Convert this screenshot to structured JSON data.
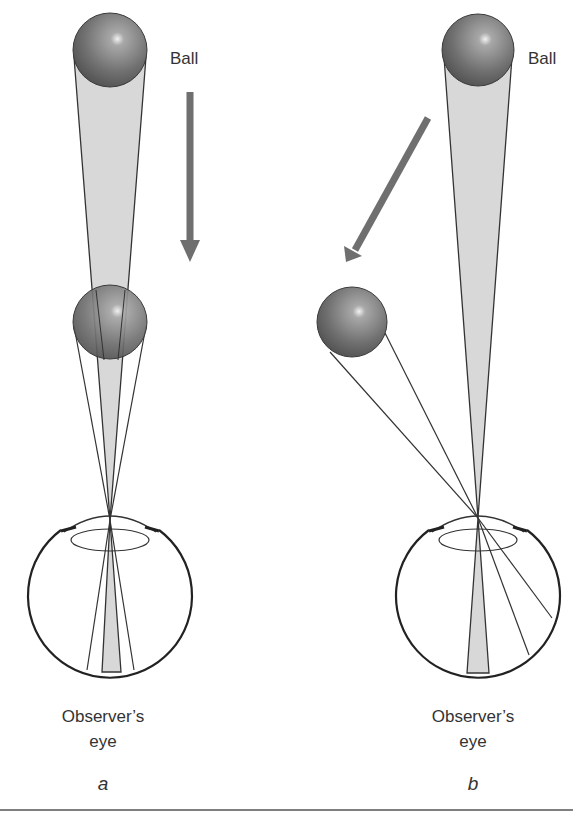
{
  "figure": {
    "panels": [
      {
        "id": "a",
        "letter": "a",
        "ball_label": "Ball",
        "eye_label_line1": "Observer’s",
        "eye_label_line2": "eye",
        "description": "Ball moving directly toward observer's eye; retinal image expands symmetrically"
      },
      {
        "id": "b",
        "letter": "b",
        "ball_label": "Ball",
        "eye_label_line1": "Observer’s",
        "eye_label_line2": "eye",
        "description": "Ball moving diagonally away from line of sight; retinal image shifts laterally"
      }
    ]
  },
  "colors": {
    "ball_dark": "#4a4a4a",
    "ball_light": "#9a9a9a",
    "cone_fill": "#d6d6d6",
    "arrow": "#6f6f6f",
    "line": "#333333",
    "rule": "#555555"
  }
}
